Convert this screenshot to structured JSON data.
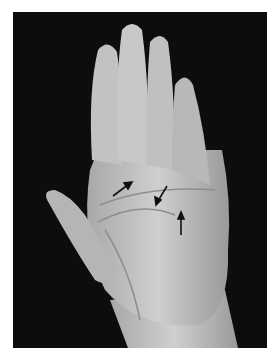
{
  "figure": {
    "background_color": "#0d0d0d",
    "skin_color": "#bdbdbd",
    "arrow_color": "#111111",
    "arrows": [
      {
        "name": "arrow-1",
        "x1": 113,
        "y1": 196,
        "x2": 131,
        "y2": 183
      },
      {
        "name": "arrow-2",
        "x1": 167,
        "y1": 186,
        "x2": 156,
        "y2": 204
      },
      {
        "name": "arrow-3",
        "x1": 181,
        "y1": 235,
        "x2": 181,
        "y2": 214
      }
    ]
  }
}
